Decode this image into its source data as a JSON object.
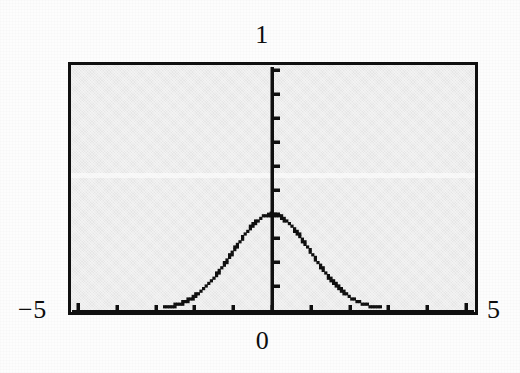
{
  "figure": {
    "kind": "scanned-textbook-plot",
    "background_color": "#ffffff",
    "plot_background_color": "#ebebeb",
    "ink_color": "#101010"
  },
  "labels": {
    "y_max": "1",
    "x_zero": "0",
    "x_min": "−5",
    "x_max": "5"
  },
  "chart_data": {
    "type": "line",
    "title": "",
    "subtitle": "",
    "xlabel": "",
    "ylabel": "",
    "xlim": [
      -5,
      5
    ],
    "ylim": [
      0,
      1
    ],
    "grid": false,
    "legend": null,
    "axis_style": {
      "frame": "full-box",
      "x_axis_position": "bottom",
      "y_axis_position": "x=0",
      "x_tick_interval": 1,
      "y_tick_interval": 0.1,
      "x_tick_labels_shown": [
        "−5",
        "0",
        "5"
      ],
      "y_tick_labels_shown": [
        "1"
      ]
    },
    "x_ticks": [
      -5,
      -4,
      -3,
      -2,
      -1,
      0,
      1,
      2,
      3,
      4,
      5
    ],
    "y_ticks": [
      0,
      0.1,
      0.2,
      0.3,
      0.4,
      0.5,
      0.6,
      0.7,
      0.8,
      0.9,
      1
    ],
    "series": [
      {
        "name": "standard normal density",
        "marker": "dotted-pixels",
        "peak_x": 0,
        "peak_y": 0.399,
        "x": [
          -5.0,
          -4.75,
          -4.5,
          -4.25,
          -4.0,
          -3.75,
          -3.5,
          -3.25,
          -3.0,
          -2.75,
          -2.5,
          -2.25,
          -2.0,
          -1.75,
          -1.5,
          -1.25,
          -1.0,
          -0.75,
          -0.5,
          -0.25,
          0.0,
          0.25,
          0.5,
          0.75,
          1.0,
          1.25,
          1.5,
          1.75,
          2.0,
          2.25,
          2.5,
          2.75,
          3.0,
          3.25,
          3.5,
          3.75,
          4.0,
          4.25,
          4.5,
          4.75,
          5.0
        ],
        "y": [
          1.5e-06,
          6.3e-06,
          1.6e-05,
          3.98e-05,
          0.0001338,
          0.0003467,
          0.0008727,
          0.0020385,
          0.0044318,
          0.0090936,
          0.0175283,
          0.031682,
          0.053991,
          0.0862773,
          0.1295176,
          0.1826491,
          0.2419707,
          0.3011374,
          0.3520653,
          0.3866681,
          0.3989423,
          0.3866681,
          0.3520653,
          0.3011374,
          0.2419707,
          0.1826491,
          0.1295176,
          0.0862773,
          0.053991,
          0.031682,
          0.0175283,
          0.0090936,
          0.0044318,
          0.0020385,
          0.0008727,
          0.0003467,
          0.0001338,
          3.98e-05,
          1.6e-05,
          6.3e-06,
          1.5e-06
        ]
      }
    ]
  }
}
